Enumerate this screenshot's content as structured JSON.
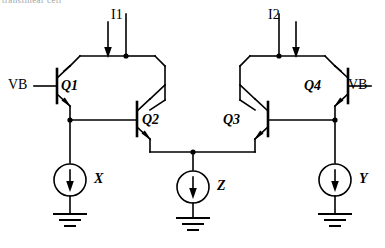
{
  "figure": {
    "title_fragment": "translinear cell",
    "background_color": "#ffffff",
    "wire_color": "#000000",
    "width": 385,
    "height": 248
  },
  "bias": {
    "vb_left_label": "VB",
    "vb_right_label": "VB"
  },
  "current_sources_top": [
    {
      "id": "I1",
      "label": "I1",
      "direction": "down"
    },
    {
      "id": "I2",
      "label": "I2",
      "direction": "down"
    }
  ],
  "transistors": [
    {
      "id": "Q1",
      "label": "Q1",
      "type": "npn",
      "orientation": "base-left"
    },
    {
      "id": "Q2",
      "label": "Q2",
      "type": "npn",
      "orientation": "base-left"
    },
    {
      "id": "Q3",
      "label": "Q3",
      "type": "npn",
      "orientation": "base-right"
    },
    {
      "id": "Q4",
      "label": "Q4",
      "type": "npn",
      "orientation": "base-right"
    }
  ],
  "current_sources_bottom": [
    {
      "id": "X",
      "label": "X",
      "direction": "down"
    },
    {
      "id": "Z",
      "label": "Z",
      "direction": "down"
    },
    {
      "id": "Y",
      "label": "Y",
      "direction": "down"
    }
  ],
  "grounds": [
    {
      "id": "gnd-x"
    },
    {
      "id": "gnd-z"
    },
    {
      "id": "gnd-y"
    }
  ]
}
